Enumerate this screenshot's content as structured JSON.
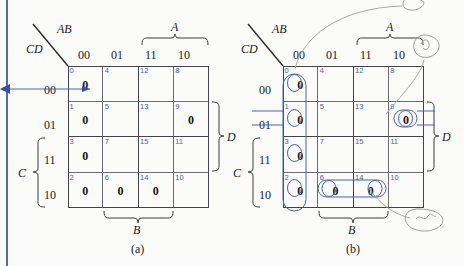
{
  "figure": {
    "caption_a": "(a)",
    "caption_b": "(b)"
  },
  "panels": [
    {
      "id": "a",
      "corner_top_label": "AB",
      "corner_bottom_label": "CD",
      "column_headers": [
        "00",
        "01",
        "11",
        "10"
      ],
      "row_headers": [
        "00",
        "01",
        "11",
        "10"
      ],
      "top_bracket_label": "A",
      "bottom_bracket_label": "B",
      "right_bracket_label": "D",
      "left_bracket_label": "C",
      "cells": [
        {
          "num": "0",
          "value": "0"
        },
        {
          "num": "4",
          "value": ""
        },
        {
          "num": "12",
          "value": ""
        },
        {
          "num": "8",
          "value": ""
        },
        {
          "num": "1",
          "value": "0"
        },
        {
          "num": "5",
          "value": ""
        },
        {
          "num": "13",
          "value": ""
        },
        {
          "num": "9",
          "value": "0"
        },
        {
          "num": "3",
          "value": "0"
        },
        {
          "num": "7",
          "value": ""
        },
        {
          "num": "15",
          "value": ""
        },
        {
          "num": "11",
          "value": ""
        },
        {
          "num": "2",
          "value": "0"
        },
        {
          "num": "6",
          "value": "0"
        },
        {
          "num": "14",
          "value": "0"
        },
        {
          "num": "10",
          "value": ""
        }
      ]
    },
    {
      "id": "b",
      "corner_top_label": "AB",
      "corner_bottom_label": "CD",
      "column_headers": [
        "00",
        "01",
        "11",
        "10"
      ],
      "row_headers": [
        "00",
        "01",
        "11",
        "10"
      ],
      "top_bracket_label": "A",
      "bottom_bracket_label": "B",
      "right_bracket_label": "D",
      "left_bracket_label": "C",
      "cells": [
        {
          "num": "0",
          "value": "0"
        },
        {
          "num": "4",
          "value": ""
        },
        {
          "num": "12",
          "value": ""
        },
        {
          "num": "8",
          "value": ""
        },
        {
          "num": "1",
          "value": "0"
        },
        {
          "num": "5",
          "value": ""
        },
        {
          "num": "13",
          "value": ""
        },
        {
          "num": "9",
          "value": "0"
        },
        {
          "num": "3",
          "value": "0"
        },
        {
          "num": "7",
          "value": ""
        },
        {
          "num": "15",
          "value": ""
        },
        {
          "num": "11",
          "value": ""
        },
        {
          "num": "2",
          "value": "0"
        },
        {
          "num": "6",
          "value": "0"
        },
        {
          "num": "14",
          "value": "0"
        },
        {
          "num": "10",
          "value": ""
        }
      ],
      "groupings": [
        {
          "name": "column-00-group",
          "shape": "vertical-oval",
          "cells": [
            "0",
            "1",
            "3",
            "2"
          ]
        },
        {
          "name": "cell-9-group",
          "shape": "small-oval",
          "cells": [
            "9"
          ]
        },
        {
          "name": "cells-6-14-group",
          "shape": "horizontal-oval",
          "cells": [
            "6",
            "14"
          ]
        }
      ]
    }
  ],
  "colors": {
    "grid_line": "#44444a",
    "cell_number": "#4a63ad",
    "annotation_blue": "#4a63ad",
    "leader_gray": "#a9a9ad",
    "page_edge": "#3a4fa0"
  }
}
